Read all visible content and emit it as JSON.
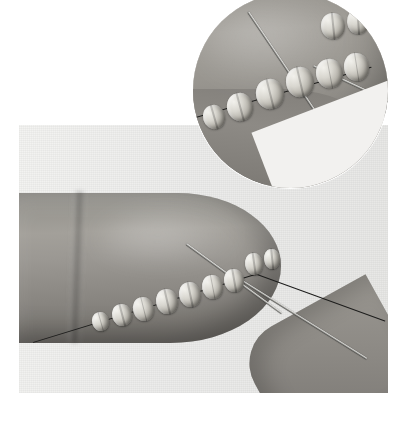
{
  "page": {
    "background_color": "#ffffff",
    "width": 409,
    "height": 427,
    "media_type": "photograph",
    "color_mode": "grayscale"
  },
  "figure": {
    "caption": ""
  },
  "main_photo": {
    "name": "main-photograph",
    "alt": "Fingertip with a row of round beads strung on a thread lying along the finger; a beading needle passes under the beads and a second hand enters from the lower right.",
    "background_color": "#ecebe9",
    "skin_tone_color": "#97948e",
    "bead_color": "#d6d3cc",
    "needle_color": "#1d1d1c",
    "bead_count": 9,
    "beads": [
      {
        "label": "bead-1",
        "x": 73,
        "y": 187,
        "w": 17,
        "h": 19,
        "rot": -16
      },
      {
        "label": "bead-2",
        "x": 93,
        "y": 179,
        "w": 20,
        "h": 22,
        "rot": -15
      },
      {
        "label": "bead-3",
        "x": 114,
        "y": 172,
        "w": 21,
        "h": 24,
        "rot": -14
      },
      {
        "label": "bead-4",
        "x": 137,
        "y": 164,
        "w": 22,
        "h": 25,
        "rot": -13
      },
      {
        "label": "bead-5",
        "x": 160,
        "y": 157,
        "w": 22,
        "h": 25,
        "rot": -12
      },
      {
        "label": "bead-6",
        "x": 183,
        "y": 150,
        "w": 21,
        "h": 24,
        "rot": -11
      },
      {
        "label": "bead-7",
        "x": 205,
        "y": 144,
        "w": 20,
        "h": 23,
        "rot": -10
      },
      {
        "label": "bead-8",
        "x": 226,
        "y": 128,
        "w": 18,
        "h": 22,
        "rot": -8
      },
      {
        "label": "bead-9",
        "x": 245,
        "y": 124,
        "w": 16,
        "h": 20,
        "rot": -6
      }
    ],
    "needles": [
      {
        "label": "needle-upper",
        "x": 167,
        "y": 118,
        "len": 118,
        "rot": 36,
        "style": "steel"
      },
      {
        "label": "needle-lower",
        "x": 212,
        "y": 148,
        "len": 160,
        "rot": 32,
        "style": "steel"
      },
      {
        "label": "thread-run",
        "x": 14,
        "y": 217,
        "len": 232,
        "rot": -17,
        "style": "thread"
      },
      {
        "label": "thread-tail",
        "x": 230,
        "y": 146,
        "len": 145,
        "rot": 20,
        "style": "thread"
      }
    ]
  },
  "inset_photo": {
    "name": "circular-inset-closeup",
    "alt": "Circular magnified close-up of the same beads and needle against the finger.",
    "shape": "circle",
    "center_x": 290,
    "center_y": 90,
    "radius": 97,
    "bead_count": 8,
    "beads": [
      {
        "label": "inset-bead-1",
        "x": 10,
        "y": 112,
        "w": 22,
        "h": 24,
        "rot": -16
      },
      {
        "label": "inset-bead-2",
        "x": 34,
        "y": 100,
        "w": 26,
        "h": 28,
        "rot": -15
      },
      {
        "label": "inset-bead-3",
        "x": 63,
        "y": 86,
        "w": 28,
        "h": 30,
        "rot": -14
      },
      {
        "label": "inset-bead-4",
        "x": 93,
        "y": 74,
        "w": 28,
        "h": 30,
        "rot": -13
      },
      {
        "label": "inset-bead-5",
        "x": 123,
        "y": 66,
        "w": 27,
        "h": 29,
        "rot": -11
      },
      {
        "label": "inset-bead-6",
        "x": 151,
        "y": 60,
        "w": 25,
        "h": 28,
        "rot": -9
      },
      {
        "label": "inset-bead-7",
        "x": 128,
        "y": 20,
        "w": 24,
        "h": 26,
        "rot": -6
      },
      {
        "label": "inset-bead-8",
        "x": 154,
        "y": 16,
        "w": 22,
        "h": 25,
        "rot": -4
      }
    ],
    "needles": [
      {
        "label": "inset-needle-upper",
        "x": 55,
        "y": 18,
        "len": 150,
        "rot": 56,
        "style": "steel"
      },
      {
        "label": "inset-needle-lower",
        "x": 120,
        "y": 72,
        "len": 110,
        "rot": 25,
        "style": "steel"
      },
      {
        "label": "inset-thread",
        "x": -4,
        "y": 126,
        "len": 190,
        "rot": -16,
        "style": "thread"
      }
    ]
  }
}
